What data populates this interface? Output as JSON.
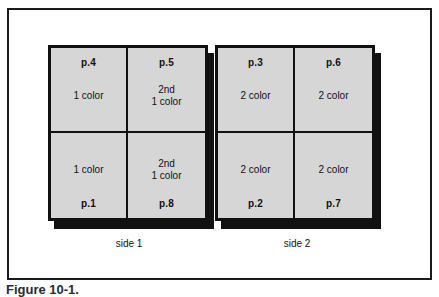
{
  "figure": {
    "caption": "Figure 10-1.",
    "frame_color": "#1a1a1a",
    "cell_fill": "#d6d6d6",
    "ink_color": "#111111"
  },
  "sides": [
    {
      "name": "side-1",
      "caption": "side 1",
      "cells": [
        {
          "page": "p.4",
          "color_label": "1 color",
          "row": "top",
          "col": "left"
        },
        {
          "page": "p.5",
          "color_label": "2nd\n1 color",
          "row": "top",
          "col": "right"
        },
        {
          "page": "p.1",
          "color_label": "1 color",
          "row": "bottom",
          "col": "left"
        },
        {
          "page": "p.8",
          "color_label": "2nd\n1 color",
          "row": "bottom",
          "col": "right"
        }
      ]
    },
    {
      "name": "side-2",
      "caption": "side 2",
      "cells": [
        {
          "page": "p.3",
          "color_label": "2 color",
          "row": "top",
          "col": "left"
        },
        {
          "page": "p.6",
          "color_label": "2 color",
          "row": "top",
          "col": "right"
        },
        {
          "page": "p.2",
          "color_label": "2 color",
          "row": "bottom",
          "col": "left"
        },
        {
          "page": "p.7",
          "color_label": "2 color",
          "row": "bottom",
          "col": "right"
        }
      ]
    }
  ]
}
